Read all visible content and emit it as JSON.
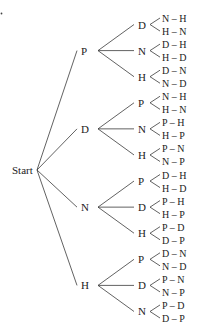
{
  "diagram": {
    "type": "tree",
    "root": "Start",
    "colors": {
      "line": "#3a3a3a",
      "text": "#222222",
      "background": "#ffffff"
    },
    "nodes": [
      {
        "label": "P",
        "children": [
          {
            "label": "D",
            "leaves": [
              "N – H",
              "H – N"
            ]
          },
          {
            "label": "N",
            "leaves": [
              "D – H",
              "H – D"
            ]
          },
          {
            "label": "H",
            "leaves": [
              "D – N",
              "N – D"
            ]
          }
        ]
      },
      {
        "label": "D",
        "children": [
          {
            "label": "P",
            "leaves": [
              "N – H",
              "H – N"
            ]
          },
          {
            "label": "N",
            "leaves": [
              "P – H",
              "H – P"
            ]
          },
          {
            "label": "H",
            "leaves": [
              "P – N",
              "N – P"
            ]
          }
        ]
      },
      {
        "label": "N",
        "children": [
          {
            "label": "P",
            "leaves": [
              "D – H",
              "H – D"
            ]
          },
          {
            "label": "D",
            "leaves": [
              "P – H",
              "H – P"
            ]
          },
          {
            "label": "H",
            "leaves": [
              "P – D",
              "D – P"
            ]
          }
        ]
      },
      {
        "label": "H",
        "children": [
          {
            "label": "P",
            "leaves": [
              "D – N",
              "N – D"
            ]
          },
          {
            "label": "D",
            "leaves": [
              "P – N",
              "N – P"
            ]
          },
          {
            "label": "N",
            "leaves": [
              "P – D",
              "D – P"
            ]
          }
        ]
      }
    ]
  }
}
